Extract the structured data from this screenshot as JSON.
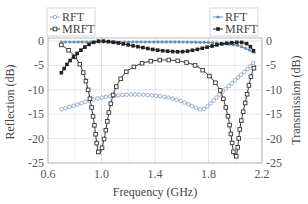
{
  "chart_data": {
    "type": "line",
    "title": "",
    "xlabel": "Frequency (GHz)",
    "ylabel_left": "Reflection (dB)",
    "ylabel_right": "Transmission (dB)",
    "xlim": [
      0.6,
      2.2
    ],
    "ylim_left": [
      -25,
      0
    ],
    "ylim_right": [
      -25,
      0
    ],
    "x_ticks": [
      "0.6",
      "1.0",
      "1.4",
      "1.8",
      "2.2"
    ],
    "y_ticks_left": [
      "0",
      "-5",
      "-10",
      "-15",
      "-20",
      "-25"
    ],
    "y_ticks_right": [
      "0",
      "-5",
      "-10",
      "-15",
      "-20",
      "-25"
    ],
    "grid": true,
    "legends": [
      {
        "position": "top-left",
        "axis": "reflection",
        "entries": [
          "RFT",
          "MRFT"
        ]
      },
      {
        "position": "top-right",
        "axis": "transmission",
        "entries": [
          "RFT",
          "MRFT"
        ]
      }
    ],
    "series": [
      {
        "name": "RFT",
        "quantity": "Reflection",
        "axis": "left",
        "color": "#8fa8c8",
        "marker": "open-circle",
        "x": [
          0.7,
          0.8,
          0.9,
          1.0,
          1.1,
          1.2,
          1.3,
          1.4,
          1.5,
          1.6,
          1.7,
          1.75,
          1.8,
          1.9,
          2.0,
          2.1,
          2.15
        ],
        "y": [
          -14,
          -13.2,
          -12.3,
          -11.6,
          -11.2,
          -11.0,
          -11.0,
          -11.2,
          -11.6,
          -12.4,
          -13.6,
          -14.0,
          -13.2,
          -10.5,
          -8.0,
          -5.5,
          -4.0
        ]
      },
      {
        "name": "MRFT",
        "quantity": "Reflection",
        "axis": "left",
        "color": "#333333",
        "marker": "open-square",
        "x": [
          0.7,
          0.75,
          0.8,
          0.85,
          0.9,
          0.94,
          0.98,
          1.02,
          1.06,
          1.1,
          1.15,
          1.2,
          1.3,
          1.4,
          1.5,
          1.6,
          1.7,
          1.78,
          1.85,
          1.9,
          1.95,
          2.0,
          2.04,
          2.08,
          2.12,
          2.15
        ],
        "y": [
          -0.8,
          -1.8,
          -3.2,
          -5.5,
          -10,
          -16,
          -23,
          -20,
          -14,
          -10,
          -7.5,
          -6,
          -4.6,
          -4.0,
          -3.9,
          -4.2,
          -5.0,
          -6.5,
          -8.5,
          -11,
          -16,
          -24,
          -17,
          -12,
          -7,
          -5
        ]
      },
      {
        "name": "RFT",
        "quantity": "Transmission",
        "axis": "right",
        "color": "#6a8fb5",
        "marker": "filled-circle",
        "x": [
          0.7,
          0.8,
          0.9,
          1.0,
          1.2,
          1.4,
          1.6,
          1.8,
          1.9,
          2.0,
          2.05,
          2.1,
          2.15
        ],
        "y": [
          -0.2,
          -0.2,
          -0.2,
          -0.2,
          -0.2,
          -0.2,
          -0.2,
          -0.3,
          -0.5,
          -0.8,
          -1.2,
          -1.8,
          -2.5
        ]
      },
      {
        "name": "MRFT",
        "quantity": "Transmission",
        "axis": "right",
        "color": "#222222",
        "marker": "filled-square",
        "x": [
          0.7,
          0.75,
          0.8,
          0.85,
          0.9,
          0.95,
          1.0,
          1.1,
          1.2,
          1.3,
          1.4,
          1.5,
          1.6,
          1.7,
          1.8,
          1.9,
          2.0,
          2.05,
          2.1,
          2.15
        ],
        "y": [
          -6.5,
          -4.5,
          -3.0,
          -1.8,
          -0.8,
          -0.2,
          0,
          -0.3,
          -0.8,
          -1.3,
          -1.8,
          -2.1,
          -2.2,
          -1.8,
          -1.2,
          -0.6,
          -0.3,
          -0.3,
          -0.8,
          -2.5
        ]
      }
    ]
  }
}
